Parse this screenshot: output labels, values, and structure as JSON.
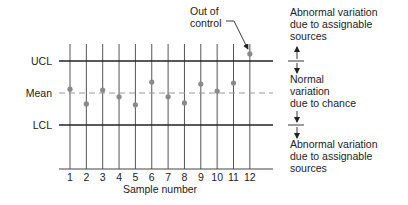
{
  "chart_data": {
    "type": "scatter",
    "title": "",
    "xlabel": "Sample number",
    "ylabel": "",
    "x": [
      1,
      2,
      3,
      4,
      5,
      6,
      7,
      8,
      9,
      10,
      11,
      12
    ],
    "tick_labels": [
      "1",
      "2",
      "3",
      "4",
      "5",
      "6",
      "7",
      "8",
      "9",
      "10",
      "11",
      "12"
    ],
    "values_relative_to_mean": [
      0.12,
      -0.34,
      0.09,
      -0.12,
      -0.37,
      0.34,
      -0.12,
      -0.31,
      0.28,
      0.06,
      0.31,
      1.22
    ],
    "limits": {
      "ucl_label": "UCL",
      "mean_label": "Mean",
      "lcl_label": "LCL",
      "ucl": 1.0,
      "mean": 0.0,
      "lcl": -1.0
    },
    "ylim": [
      -2.4,
      1.55
    ],
    "grid": "vertical lines at each sample",
    "annotations": {
      "out_of_control": {
        "lines": [
          "Out of",
          "control"
        ],
        "target_sample": 12
      },
      "upper_zone": [
        "Abnormal variation",
        "due to assignable",
        "sources"
      ],
      "middle_zone": [
        "Normal",
        "variation",
        "due to chance"
      ],
      "lower_zone": [
        "Abnormal variation",
        "due to assignable",
        "sources"
      ]
    }
  },
  "colors": {
    "axis": "#222222",
    "sample_line": "#555555",
    "mean_dash": "#999999",
    "point": "#8a8a8a",
    "text": "#222222"
  }
}
